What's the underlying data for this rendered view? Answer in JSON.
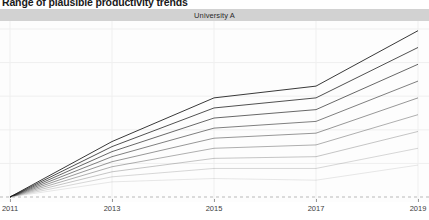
{
  "chart_title": "Range of plausible productivity trends",
  "facet": {
    "label": "University A"
  },
  "chart_data": {
    "type": "line",
    "title": "Range of plausible productivity trends",
    "subtitle": "",
    "facet_label": "University A",
    "xlabel": "",
    "ylabel": "",
    "grid": true,
    "legend": false,
    "legend_position": "none",
    "xlim": [
      2011,
      2019
    ],
    "ylim": [
      0,
      100
    ],
    "x": [
      2011,
      2013,
      2015,
      2017,
      2019
    ],
    "x_tick_labels": [
      "2011",
      "2013",
      "2015",
      "2017",
      "2019"
    ],
    "reference_line": {
      "y": 0,
      "style": "dashed",
      "color": "#b9b9b9"
    },
    "series": [
      {
        "name": "Scenario 1",
        "values": [
          0,
          33,
          59,
          66,
          99
        ],
        "opacity": 1.0
      },
      {
        "name": "Scenario 2",
        "values": [
          0,
          30,
          53,
          59,
          89
        ],
        "opacity": 0.88
      },
      {
        "name": "Scenario 3",
        "values": [
          0,
          27,
          47,
          52,
          79
        ],
        "opacity": 0.76
      },
      {
        "name": "Scenario 4",
        "values": [
          0,
          24,
          41,
          45,
          69
        ],
        "opacity": 0.64
      },
      {
        "name": "Scenario 5",
        "values": [
          0,
          21,
          35,
          38,
          59
        ],
        "opacity": 0.52
      },
      {
        "name": "Scenario 6",
        "values": [
          0,
          18,
          29,
          31,
          49
        ],
        "opacity": 0.4
      },
      {
        "name": "Scenario 7",
        "values": [
          0,
          15,
          23,
          24,
          39
        ],
        "opacity": 0.29
      },
      {
        "name": "Scenario 8",
        "values": [
          0,
          12,
          17,
          17,
          29
        ],
        "opacity": 0.2
      },
      {
        "name": "Scenario 9",
        "values": [
          0,
          9,
          11,
          10,
          19
        ],
        "opacity": 0.12
      }
    ],
    "line_color": "#222222",
    "grid_color": "#efefef",
    "panel_background": "#fdfdfd",
    "strip_background": "#d2d2d2"
  }
}
